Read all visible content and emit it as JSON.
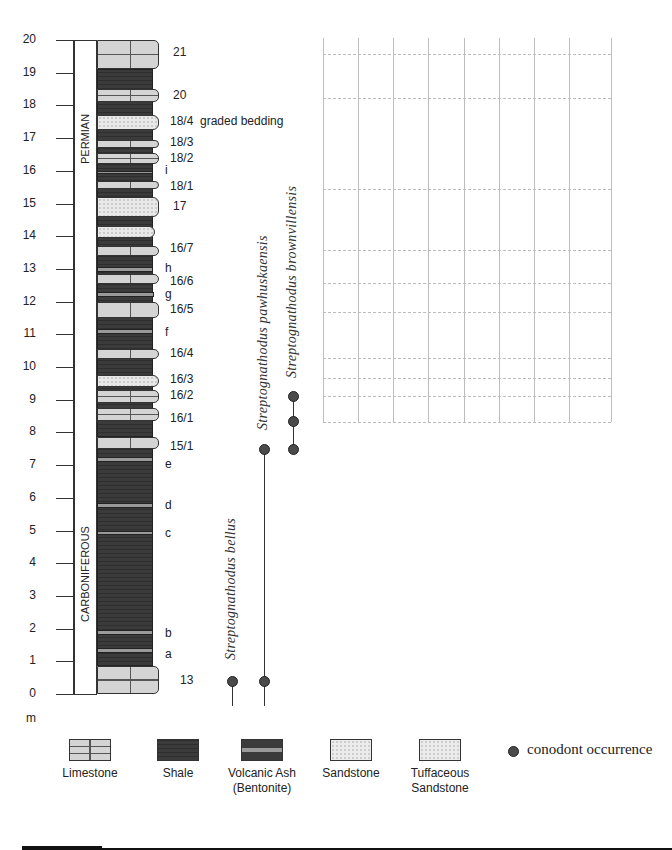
{
  "scale": {
    "unit": "m",
    "ticks": [
      "0",
      "1",
      "2",
      "3",
      "4",
      "5",
      "6",
      "7",
      "8",
      "9",
      "10",
      "11",
      "12",
      "13",
      "14",
      "15",
      "16",
      "17",
      "18",
      "19",
      "20"
    ],
    "zero_y": 694,
    "px_per_m": 32.7
  },
  "periods": [
    {
      "label": "PERMIAN",
      "from_m": 14.0,
      "to_m": 20.0
    },
    {
      "label": "CARBONIFEROUS",
      "from_m": 0.0,
      "to_m": 7.4
    }
  ],
  "beds": [
    {
      "type": "lime",
      "bottom": 0,
      "top": 0.85,
      "width": 62,
      "label": "13",
      "label_m": 0.4
    },
    {
      "type": "shale",
      "bottom": 0.85,
      "top": 7.6,
      "width": 56
    },
    {
      "type": "ash",
      "bottom": 1.25,
      "top": 1.4,
      "width": 56,
      "label": "a",
      "label_m": 1.2
    },
    {
      "type": "ash",
      "bottom": 1.8,
      "top": 1.95,
      "width": 56,
      "label": "b",
      "label_m": 1.85
    },
    {
      "type": "ash",
      "bottom": 4.85,
      "top": 5.0,
      "width": 56,
      "label": "c",
      "label_m": 4.9
    },
    {
      "type": "ash",
      "bottom": 5.7,
      "top": 5.85,
      "width": 56,
      "label": "d",
      "label_m": 5.75
    },
    {
      "type": "ash",
      "bottom": 7.1,
      "top": 7.25,
      "width": 56,
      "label": "e",
      "label_m": 7.0
    },
    {
      "type": "lime",
      "bottom": 7.5,
      "top": 7.85,
      "width": 62,
      "label": "15/1",
      "label_m": 7.55
    },
    {
      "type": "shale",
      "bottom": 7.85,
      "top": 19.1,
      "width": 56
    },
    {
      "type": "lime",
      "bottom": 8.35,
      "top": 8.75,
      "width": 62,
      "label": "16/1",
      "label_m": 8.4
    },
    {
      "type": "lime",
      "bottom": 8.9,
      "top": 9.3,
      "width": 62,
      "label": "16/2",
      "label_m": 9.1
    },
    {
      "type": "sand",
      "bottom": 9.4,
      "top": 9.75,
      "width": 62,
      "label": "16/3",
      "label_m": 9.6
    },
    {
      "type": "lime",
      "bottom": 10.25,
      "top": 10.55,
      "width": 62,
      "label": "16/4",
      "label_m": 10.4
    },
    {
      "type": "ash",
      "bottom": 11.0,
      "top": 11.15,
      "width": 56,
      "label": "f",
      "label_m": 11.05
    },
    {
      "type": "lime",
      "bottom": 11.5,
      "top": 12.0,
      "width": 62,
      "label": "16/5",
      "label_m": 11.75
    },
    {
      "type": "ash",
      "bottom": 12.15,
      "top": 12.3,
      "width": 57,
      "label": "g",
      "label_m": 12.2
    },
    {
      "type": "lime",
      "bottom": 12.55,
      "top": 12.85,
      "width": 62,
      "label": "16/6",
      "label_m": 12.6
    },
    {
      "type": "ash",
      "bottom": 12.9,
      "top": 13.05,
      "width": 56,
      "label": "h",
      "label_m": 13.0
    },
    {
      "type": "lime",
      "bottom": 13.4,
      "top": 13.7,
      "width": 62,
      "label": "16/7",
      "label_m": 13.6
    },
    {
      "type": "sand",
      "bottom": 13.95,
      "top": 14.3,
      "width": 58
    },
    {
      "type": "sand",
      "bottom": 14.6,
      "top": 15.2,
      "width": 62,
      "label": "17",
      "label_m": 14.9
    },
    {
      "type": "lime",
      "bottom": 15.45,
      "top": 15.7,
      "width": 62,
      "label": "18/1",
      "label_m": 15.5
    },
    {
      "type": "ash",
      "bottom": 15.9,
      "top": 16.0,
      "width": 56,
      "label": "i",
      "label_m": 16.0
    },
    {
      "type": "lime",
      "bottom": 16.2,
      "top": 16.55,
      "width": 62,
      "label": "18/2",
      "label_m": 16.35
    },
    {
      "type": "lime",
      "bottom": 16.7,
      "top": 16.95,
      "width": 62,
      "label": "18/3",
      "label_m": 16.85
    },
    {
      "type": "sand",
      "bottom": 17.25,
      "top": 17.7,
      "width": 62,
      "label": "18/4",
      "label_m": 17.5
    },
    {
      "type": "lime",
      "bottom": 18.1,
      "top": 18.5,
      "width": 62,
      "label": "20",
      "label_m": 18.3
    },
    {
      "type": "lime",
      "bottom": 19.1,
      "top": 20.0,
      "width": 62,
      "label": "21",
      "label_m": 19.6
    }
  ],
  "annotations": [
    {
      "text": "graded bedding",
      "at_m": 17.5
    }
  ],
  "species": [
    {
      "name": "Streptognathodus bellus",
      "x": 232,
      "occurrences_m": [
        0.4
      ],
      "range_from_m": 0.0,
      "range_to_m": 0.4
    },
    {
      "name": "Streptognathodus pawhuskaensis",
      "x": 264,
      "occurrences_m": [
        0.4,
        7.5
      ],
      "range_from_m": 0.0,
      "range_to_m": 7.5
    },
    {
      "name": "Streptognathodus brownvillensis",
      "x": 293,
      "occurrences_m": [
        7.5,
        8.35,
        9.1
      ],
      "range_from_m": 7.2,
      "range_to_m": 9.1
    }
  ],
  "grid": {
    "verticals_x": [
      323,
      358,
      393,
      428,
      464,
      499,
      534,
      569,
      611
    ],
    "dashed_y": [
      54,
      98,
      189,
      250,
      283,
      312,
      358,
      378,
      396,
      422
    ],
    "top": 38,
    "bottom": 422
  },
  "legend": {
    "items": [
      {
        "type": "lime",
        "label": "Limestone"
      },
      {
        "type": "shale",
        "label": "Shale"
      },
      {
        "type": "ash",
        "label": "Volcanic Ash\n(Bentonite)"
      },
      {
        "type": "sand",
        "label": "Sandstone"
      },
      {
        "type": "tuff",
        "label": "Tuffaceous\nSandstone"
      }
    ],
    "conodont_label": "conodont occurrence"
  },
  "colors": {
    "shale": "#3b3b3b",
    "limestone": "#d4d4d4",
    "sandstone": "#e9e9e9",
    "ash": "#9a9a9a",
    "dot": "#4a4a4a",
    "grid": "#bdbdbd"
  }
}
